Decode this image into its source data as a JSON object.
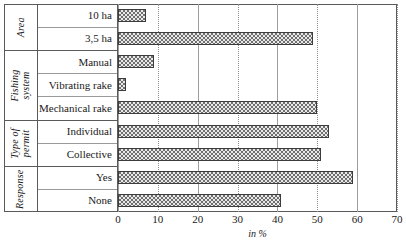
{
  "chart_data": {
    "type": "bar",
    "orientation": "horizontal",
    "title": "",
    "xlabel": "in %",
    "ylabel": "",
    "xlim": [
      0,
      70
    ],
    "xticks": [
      0,
      10,
      20,
      30,
      40,
      50,
      60,
      70
    ],
    "grid": true,
    "legend": "none",
    "groups": [
      {
        "name": "Area",
        "categories": [
          "10 ha",
          "3,5 ha"
        ],
        "values": [
          7,
          49
        ]
      },
      {
        "name": "Fishing system",
        "categories": [
          "Manual",
          "Vibrating rake",
          "Mechanical rake"
        ],
        "values": [
          9,
          2,
          50
        ]
      },
      {
        "name": "Type of permit",
        "categories": [
          "Individual",
          "Collective"
        ],
        "values": [
          53,
          51
        ]
      },
      {
        "name": "Response",
        "categories": [
          "Yes",
          "None"
        ],
        "values": [
          59,
          41
        ]
      }
    ],
    "categories": [
      "10 ha",
      "3,5 ha",
      "Manual",
      "Vibrating rake",
      "Mechanical rake",
      "Individual",
      "Collective",
      "Yes",
      "None"
    ],
    "values": [
      7,
      49,
      9,
      2,
      50,
      53,
      51,
      59,
      41
    ],
    "colors": {
      "bar_fill": "#e9e9e9",
      "bar_pattern": "#6f6f6f",
      "bar_border": "#3c3c3c",
      "frame": "#5a5a5a",
      "gridline": "#8e8e8e",
      "text": "#1a1a1a"
    }
  }
}
